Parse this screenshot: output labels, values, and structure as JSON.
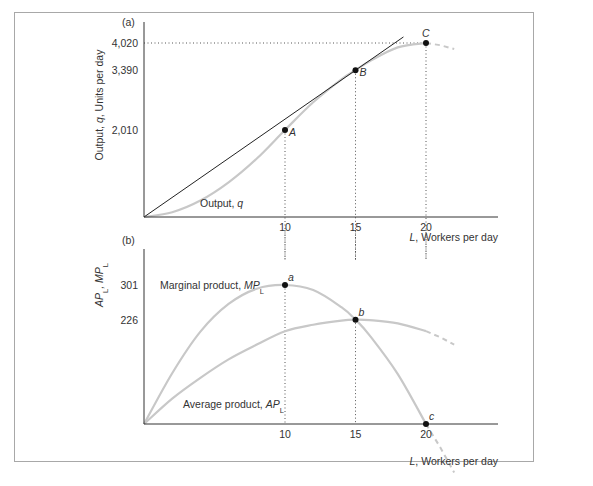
{
  "chart_data": [
    {
      "panel_label": "(a)",
      "type": "line",
      "title": "",
      "xlabel": "L, Workers per day",
      "xlabel_var": "L",
      "xlabel_rest": ", Workers per day",
      "ylabel": "Output, q, Units per day",
      "ylabel_parts": [
        "Output, ",
        "q",
        ", Units per day"
      ],
      "xlim": [
        0,
        25
      ],
      "ylim": [
        0,
        4200
      ],
      "x_ticks": [
        10,
        15,
        20
      ],
      "x_tick_labels": [
        "10",
        "15",
        "20"
      ],
      "y_ticks": [
        2010,
        3390,
        4020
      ],
      "y_tick_labels": [
        "2,010",
        "3,390",
        "4,020"
      ],
      "grid": false,
      "series": [
        {
          "name": "Output, q",
          "label_main": "Output, ",
          "label_var": "q",
          "color": "#c8c8c8",
          "x": [
            0,
            2,
            4,
            6,
            8,
            10,
            12,
            14,
            15,
            16,
            18,
            20
          ],
          "y": [
            0,
            110,
            380,
            800,
            1350,
            2010,
            2650,
            3180,
            3390,
            3600,
            3920,
            4020
          ],
          "extension_dashed": {
            "x": [
              20,
              21,
              22
            ],
            "y": [
              4020,
              3970,
              3880
            ]
          }
        },
        {
          "name": "Tangent ray from origin",
          "color": "#222222",
          "x": [
            0,
            18.4
          ],
          "y": [
            0,
            4160
          ]
        }
      ],
      "points": [
        {
          "label": "A",
          "x": 10,
          "y": 2010
        },
        {
          "label": "B",
          "x": 15,
          "y": 3390
        },
        {
          "label": "C",
          "x": 20,
          "y": 4020
        }
      ],
      "guides": {
        "horizontal_dotted": [
          {
            "y": 4020,
            "x_to": 20
          }
        ],
        "vertical_dotted": [
          10,
          15,
          20
        ]
      }
    },
    {
      "panel_label": "(b)",
      "type": "line",
      "title": "",
      "xlabel": "L, Workers per day",
      "xlabel_var": "L",
      "xlabel_rest": ", Workers per day",
      "ylabel": "APL, MPL",
      "ylabel_parts": [
        "AP",
        "L",
        ", MP",
        "L"
      ],
      "xlim": [
        0,
        25
      ],
      "ylim": [
        0,
        320
      ],
      "x_ticks": [
        10,
        15,
        20
      ],
      "x_tick_labels": [
        "10",
        "15",
        "20"
      ],
      "y_ticks": [
        226,
        301
      ],
      "y_tick_labels": [
        "226",
        "301"
      ],
      "grid": false,
      "series": [
        {
          "name": "Marginal product, MPL",
          "label_main": "Marginal product, ",
          "label_var": "MP",
          "label_sub": "L",
          "color": "#c8c8c8",
          "x": [
            0,
            2,
            4,
            6,
            8,
            10,
            12,
            14,
            15,
            16,
            18,
            20
          ],
          "y": [
            0,
            110,
            200,
            260,
            293,
            301,
            290,
            253,
            226,
            192,
            108,
            0
          ],
          "extension_dashed": {
            "x": [
              20,
              21,
              22
            ],
            "y": [
              0,
              -50,
              -105
            ]
          }
        },
        {
          "name": "Average product, APL",
          "label_main": "Average product, ",
          "label_var": "AP",
          "label_sub": "L",
          "color": "#c8c8c8",
          "x": [
            0,
            2,
            4,
            6,
            8,
            10,
            12,
            14,
            15,
            16,
            18,
            20
          ],
          "y": [
            0,
            55,
            100,
            140,
            172,
            201,
            215,
            224,
            226,
            225,
            218,
            201
          ],
          "extension_dashed": {
            "x": [
              20,
              21,
              22
            ],
            "y": [
              201,
              188,
              172
            ]
          }
        }
      ],
      "points": [
        {
          "label": "a",
          "x": 10,
          "y": 301
        },
        {
          "label": "b",
          "x": 15,
          "y": 226
        },
        {
          "label": "c",
          "x": 20,
          "y": 0
        }
      ],
      "guides": {
        "vertical_dotted": [
          10,
          15,
          20
        ]
      }
    }
  ]
}
